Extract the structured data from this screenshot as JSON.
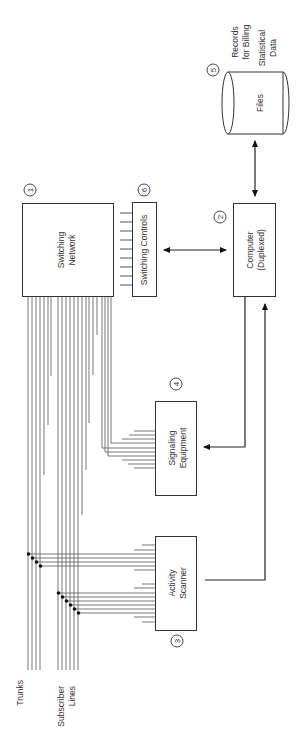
{
  "diagram": {
    "orientation": "rotated-90-ccw",
    "nodes": {
      "switching_network": {
        "number": "1",
        "line1": "Switching",
        "line2": "Network"
      },
      "computer": {
        "number": "2",
        "line1": "Computer",
        "line2": "(Duplexed)"
      },
      "activity_scanner": {
        "number": "3",
        "line1": "Activity",
        "line2": "Scanner"
      },
      "signaling_equipment": {
        "number": "4",
        "line1": "Signaling",
        "line2": "Equipment"
      },
      "files": {
        "number": "5",
        "label": "Files"
      },
      "switching_controls": {
        "number": "6",
        "label": "Switching Controls"
      }
    },
    "annotations": {
      "files_note_line1": "Records",
      "files_note_line2": "for Billing",
      "files_note_line3": "Statistical",
      "files_note_line4": "Data",
      "trunks": "Trunks",
      "subscriber_line1": "Subscriber",
      "subscriber_line2": "Lines"
    },
    "edges": [
      {
        "from": "files",
        "to": "computer",
        "type": "bidirectional"
      },
      {
        "from": "switching_controls",
        "to": "computer",
        "type": "bidirectional"
      },
      {
        "from": "computer",
        "to": "signaling_equipment",
        "type": "directed"
      },
      {
        "from": "activity_scanner",
        "to": "computer",
        "type": "directed"
      },
      {
        "from": "switching_network",
        "to": "signaling_equipment",
        "type": "lines"
      },
      {
        "from": "switching_network",
        "to": "activity_scanner",
        "type": "lines"
      },
      {
        "from": "switching_controls",
        "to": "switching_network",
        "type": "control-lines"
      }
    ]
  }
}
